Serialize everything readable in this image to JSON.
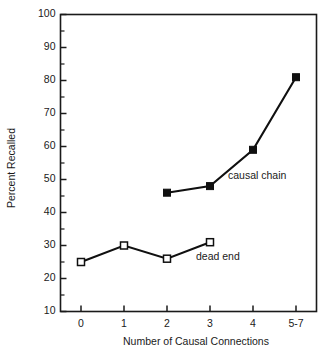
{
  "chart_data": {
    "type": "line",
    "title": "",
    "xlabel": "Number of Causal Connections",
    "ylabel": "Percent Recalled",
    "categories": [
      "0",
      "1",
      "2",
      "3",
      "4",
      "5-7"
    ],
    "xlim": [
      0,
      5
    ],
    "ylim": [
      10,
      100
    ],
    "ytick_labels": [
      "10",
      "20",
      "30",
      "40",
      "50",
      "60",
      "70",
      "80",
      "90",
      "100"
    ],
    "ytick_values": [
      10,
      20,
      30,
      40,
      50,
      60,
      70,
      80,
      90,
      100
    ],
    "yminor_step": 5,
    "grid": false,
    "legend": "inline-annotations",
    "frame": "box",
    "series": [
      {
        "name": "causal chain",
        "marker": "filled-square",
        "annotation": "causal chain",
        "x": [
          "2",
          "3",
          "4",
          "5-7"
        ],
        "values": [
          46,
          48,
          59,
          81
        ]
      },
      {
        "name": "dead end",
        "marker": "open-square",
        "annotation": "dead end",
        "x": [
          "0",
          "1",
          "2",
          "3"
        ],
        "values": [
          25,
          30,
          26,
          31
        ]
      }
    ],
    "colors": {
      "line": "#101010",
      "axis": "#1a1a1a",
      "background": "#ffffff",
      "marker_open_fill": "#ffffff"
    }
  }
}
